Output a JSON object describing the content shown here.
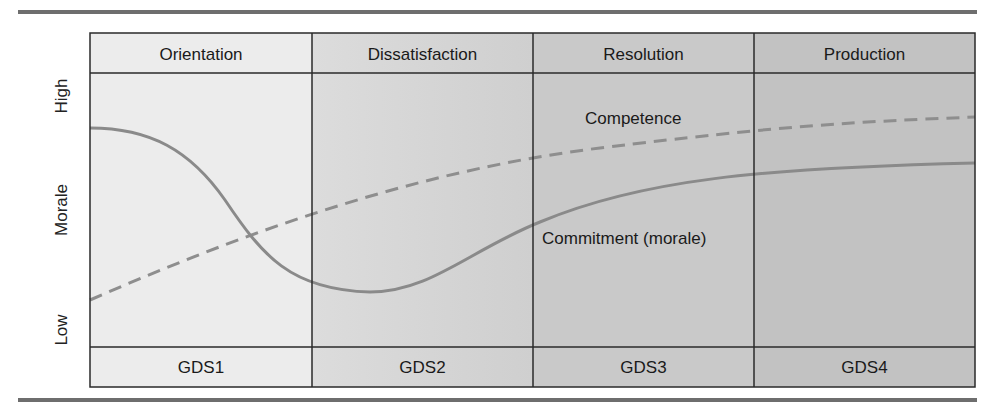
{
  "diagram": {
    "y_axis": {
      "title": "Morale",
      "high_label": "High",
      "low_label": "Low"
    },
    "stages": [
      {
        "header": "Orientation",
        "footer": "GDS1",
        "fill": "#ececec"
      },
      {
        "header": "Dissatisfaction",
        "footer": "GDS2",
        "fill": "#dcdcdc"
      },
      {
        "header": "Resolution",
        "footer": "GDS3",
        "fill": "#c9c9c9"
      },
      {
        "header": "Production",
        "footer": "GDS4",
        "fill": "#c2c2c2"
      }
    ],
    "curves": {
      "competence": {
        "label": "Competence",
        "style": "dashed",
        "color": "#8e8e8e"
      },
      "commitment": {
        "label": "Commitment (morale)",
        "style": "solid",
        "color": "#8a8a8a"
      }
    },
    "colors": {
      "rule": "#6e6e6e",
      "border": "#2a2a2a"
    }
  }
}
